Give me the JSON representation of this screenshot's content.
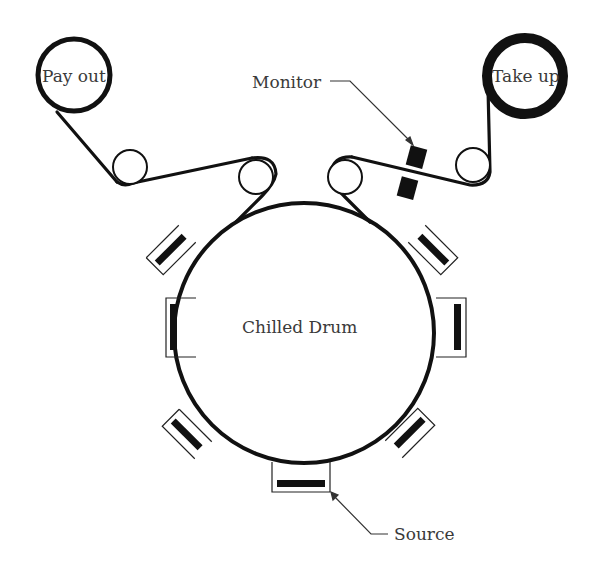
{
  "diagram": {
    "type": "roll-to-roll coating system schematic",
    "labels": {
      "payout": "Pay out",
      "takeup": "Take up",
      "monitor": "Monitor",
      "drum": "Chilled Drum",
      "source": "Source"
    },
    "colors": {
      "ink": "#111111",
      "text": "#3a3a3a",
      "background": "#ffffff"
    },
    "components": [
      {
        "id": "payout-roll",
        "kind": "roll",
        "label": "Pay out"
      },
      {
        "id": "idler-1",
        "kind": "idler-roller"
      },
      {
        "id": "idler-2",
        "kind": "idler-roller"
      },
      {
        "id": "chilled-drum",
        "kind": "drum",
        "label": "Chilled Drum"
      },
      {
        "id": "idler-3",
        "kind": "idler-roller"
      },
      {
        "id": "monitor",
        "kind": "sensor",
        "label": "Monitor"
      },
      {
        "id": "idler-4",
        "kind": "idler-roller"
      },
      {
        "id": "takeup-roll",
        "kind": "roll",
        "label": "Take up"
      }
    ],
    "sources_count": 7
  }
}
